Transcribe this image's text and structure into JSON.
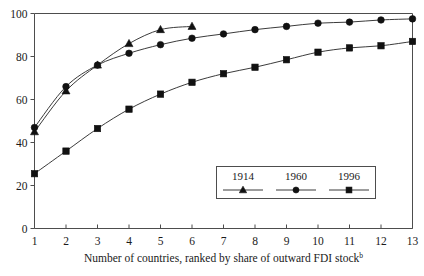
{
  "chart_data": {
    "type": "line",
    "title": "",
    "subtitle": "",
    "xlabel": "Number of countries, ranked by share of outward FDI stock",
    "xlabel_superscript": "b",
    "ylabel": "",
    "xlim": [
      1,
      13
    ],
    "ylim": [
      0,
      100
    ],
    "grid": false,
    "legend_position": "inside-bottom-right",
    "x": [
      1,
      2,
      3,
      4,
      5,
      6,
      7,
      8,
      9,
      10,
      11,
      12,
      13
    ],
    "xticklabels": [
      "1",
      "2",
      "3",
      "4",
      "5",
      "6",
      "7",
      "8",
      "9",
      "10",
      "11",
      "12",
      "13"
    ],
    "yticks": [
      0,
      20,
      40,
      60,
      80,
      100
    ],
    "yticklabels": [
      "0",
      "20",
      "40",
      "60",
      "80",
      "100"
    ],
    "series": [
      {
        "name": "1914",
        "marker": "triangle",
        "x": [
          1,
          2,
          3,
          4,
          5,
          6
        ],
        "values": [
          45,
          64,
          76,
          86,
          92.5,
          94
        ]
      },
      {
        "name": "1960",
        "marker": "circle",
        "x": [
          1,
          2,
          3,
          4,
          5,
          6,
          7,
          8,
          9,
          10,
          11,
          12,
          13
        ],
        "values": [
          47,
          66,
          76,
          81.5,
          85.5,
          88.5,
          90.5,
          92.5,
          94,
          95.5,
          96,
          97,
          97.5
        ]
      },
      {
        "name": "1996",
        "marker": "square",
        "x": [
          1,
          2,
          3,
          4,
          5,
          6,
          7,
          8,
          9,
          10,
          11,
          12,
          13
        ],
        "values": [
          25.5,
          36,
          46.5,
          55.5,
          62.5,
          68,
          72,
          75,
          78.5,
          82,
          84,
          85,
          87
        ]
      }
    ]
  },
  "legend": {
    "entries": [
      {
        "label": "1914",
        "marker": "triangle"
      },
      {
        "label": "1960",
        "marker": "circle"
      },
      {
        "label": "1996",
        "marker": "square"
      }
    ]
  },
  "colors": {
    "marker": "#111111",
    "line": "#3b3b3b",
    "frame": "#4d4d4d",
    "text": "#1a1a1a",
    "background": "#ffffff"
  }
}
